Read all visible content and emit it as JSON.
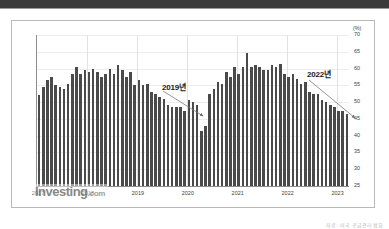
{
  "watermark": {
    "brand": "Investing",
    "suffix": ".com"
  },
  "source_caption": "자료: 미국 공급관리협회",
  "annotations": [
    {
      "id": "annot-2019",
      "label": "2019년"
    },
    {
      "id": "annot-2022",
      "label": "2022년"
    }
  ],
  "chart_data": {
    "type": "bar",
    "title": "",
    "subtitle": "",
    "xlabel": "",
    "ylabel": "",
    "unit_label": "(%)",
    "ylim": [
      25,
      70
    ],
    "ytick_values": [
      25,
      30,
      35,
      40,
      45,
      50,
      55,
      60,
      65,
      70
    ],
    "ytick_labels": [
      "25",
      "30",
      "35",
      "40",
      "45",
      "50",
      "55",
      "60",
      "65",
      "70"
    ],
    "grid": true,
    "grid_axis": "both",
    "legend": false,
    "legend_position": "none",
    "xtick_labels": [
      "2017",
      "2018",
      "2019",
      "2020",
      "2021",
      "2022",
      "2023"
    ],
    "xtick_positions": [
      0,
      12,
      24,
      36,
      48,
      60,
      72
    ],
    "bar_color": "#4a4a4a",
    "annotations": [
      {
        "text": "2019년",
        "points_to_x_index": 34,
        "points_to_value": 54.0,
        "arrow": true
      },
      {
        "text": "2022년",
        "points_to_x_index": 71,
        "points_to_value": 54.0,
        "arrow": true
      }
    ],
    "categories": [
      "2017-01",
      "2017-02",
      "2017-03",
      "2017-04",
      "2017-05",
      "2017-06",
      "2017-07",
      "2017-08",
      "2017-09",
      "2017-10",
      "2017-11",
      "2017-12",
      "2018-01",
      "2018-02",
      "2018-03",
      "2018-04",
      "2018-05",
      "2018-06",
      "2018-07",
      "2018-08",
      "2018-09",
      "2018-10",
      "2018-11",
      "2018-12",
      "2019-01",
      "2019-02",
      "2019-03",
      "2019-04",
      "2019-05",
      "2019-06",
      "2019-07",
      "2019-08",
      "2019-09",
      "2019-10",
      "2019-11",
      "2019-12",
      "2020-01",
      "2020-02",
      "2020-03",
      "2020-04",
      "2020-05",
      "2020-06",
      "2020-07",
      "2020-08",
      "2020-09",
      "2020-10",
      "2020-11",
      "2020-12",
      "2021-01",
      "2021-02",
      "2021-03",
      "2021-04",
      "2021-05",
      "2021-06",
      "2021-07",
      "2021-08",
      "2021-09",
      "2021-10",
      "2021-11",
      "2021-12",
      "2022-01",
      "2022-02",
      "2022-03",
      "2022-04",
      "2022-05",
      "2022-06",
      "2022-07",
      "2022-08",
      "2022-09",
      "2022-10",
      "2022-11",
      "2022-12",
      "2023-01",
      "2023-02",
      "2023-03"
    ],
    "values": [
      52.0,
      54.5,
      56.5,
      57.5,
      55.0,
      54.5,
      54.0,
      55.5,
      58.5,
      60.5,
      58.5,
      59.5,
      59.0,
      60.0,
      59.0,
      57.5,
      58.5,
      60.0,
      58.5,
      61.0,
      59.5,
      57.5,
      59.0,
      55.0,
      56.5,
      55.0,
      55.5,
      53.0,
      52.5,
      51.5,
      51.0,
      49.0,
      48.5,
      48.5,
      48.5,
      47.5,
      50.5,
      50.0,
      49.0,
      41.5,
      43.0,
      52.5,
      54.0,
      56.0,
      55.5,
      59.0,
      57.5,
      60.5,
      58.5,
      60.5,
      64.5,
      60.5,
      61.0,
      60.5,
      59.5,
      59.5,
      61.0,
      60.5,
      61.5,
      58.5,
      57.5,
      58.5,
      57.0,
      55.5,
      56.0,
      53.0,
      52.5,
      52.5,
      50.5,
      50.0,
      49.0,
      48.5,
      47.5,
      47.5,
      46.5
    ]
  }
}
